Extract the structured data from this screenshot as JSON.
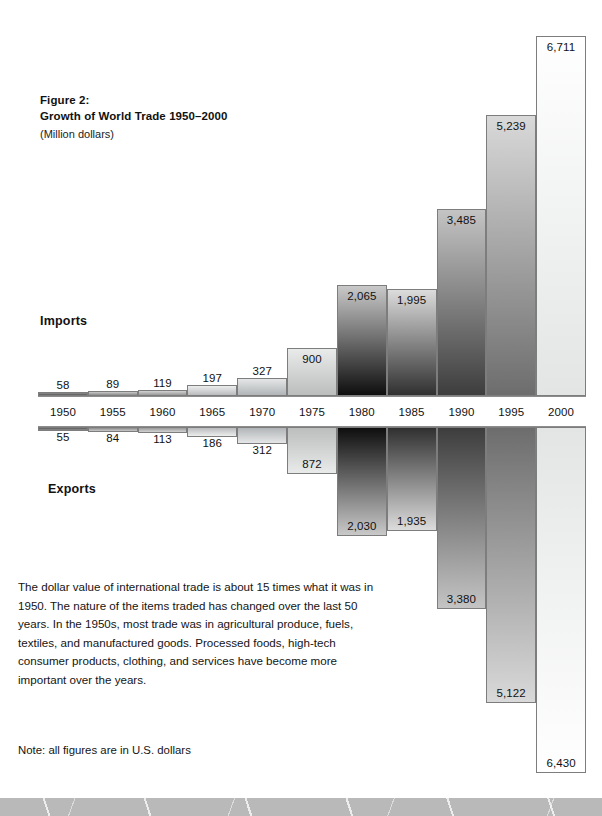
{
  "figure": {
    "label": "Figure 2:",
    "title": "Growth of World Trade 1950–2000",
    "units": "(Million dollars)"
  },
  "series_labels": {
    "imports": "Imports",
    "exports": "Exports"
  },
  "body_text": "The dollar value of international trade is about 15 times what it was in 1950. The nature of the items traded has changed over the last 50 years. In the 1950s, most trade was in agricultural produce, fuels, textiles, and manufactured goods. Processed foods, high-tech consumer products, clothing, and services have become more important over the years.",
  "note": "Note: all figures are in U.S. dollars",
  "chart_data": {
    "type": "bar",
    "title": "Growth of World Trade 1950–2000",
    "subtitle": "(Million dollars)",
    "xlabel": "",
    "ylabel": "Million dollars",
    "orientation": "vertical-bidirectional",
    "grid": false,
    "legend_position": "inline-left",
    "categories": [
      "1950",
      "1955",
      "1960",
      "1965",
      "1970",
      "1975",
      "1980",
      "1985",
      "1990",
      "1995",
      "2000"
    ],
    "series": [
      {
        "name": "Imports",
        "direction": "up",
        "values": [
          58,
          89,
          119,
          197,
          327,
          900,
          2065,
          1995,
          3485,
          5239,
          6711
        ],
        "labels": [
          "58",
          "89",
          "119",
          "197",
          "327",
          "900",
          "2,065",
          "1,995",
          "3,485",
          "5,239",
          "6,711"
        ]
      },
      {
        "name": "Exports",
        "direction": "down",
        "values": [
          55,
          84,
          113,
          186,
          312,
          872,
          2030,
          1935,
          3380,
          5122,
          6430
        ],
        "labels": [
          "55",
          "84",
          "113",
          "186",
          "312",
          "872",
          "2,030",
          "1,935",
          "3,380",
          "5,122",
          "6,430"
        ]
      }
    ],
    "ylim": [
      0,
      6711
    ]
  },
  "style": {
    "bar_border": "#7d7d7d",
    "axis_line": "#8c8c8c",
    "text": "#111111",
    "footer_band": "#b9b9b9"
  }
}
